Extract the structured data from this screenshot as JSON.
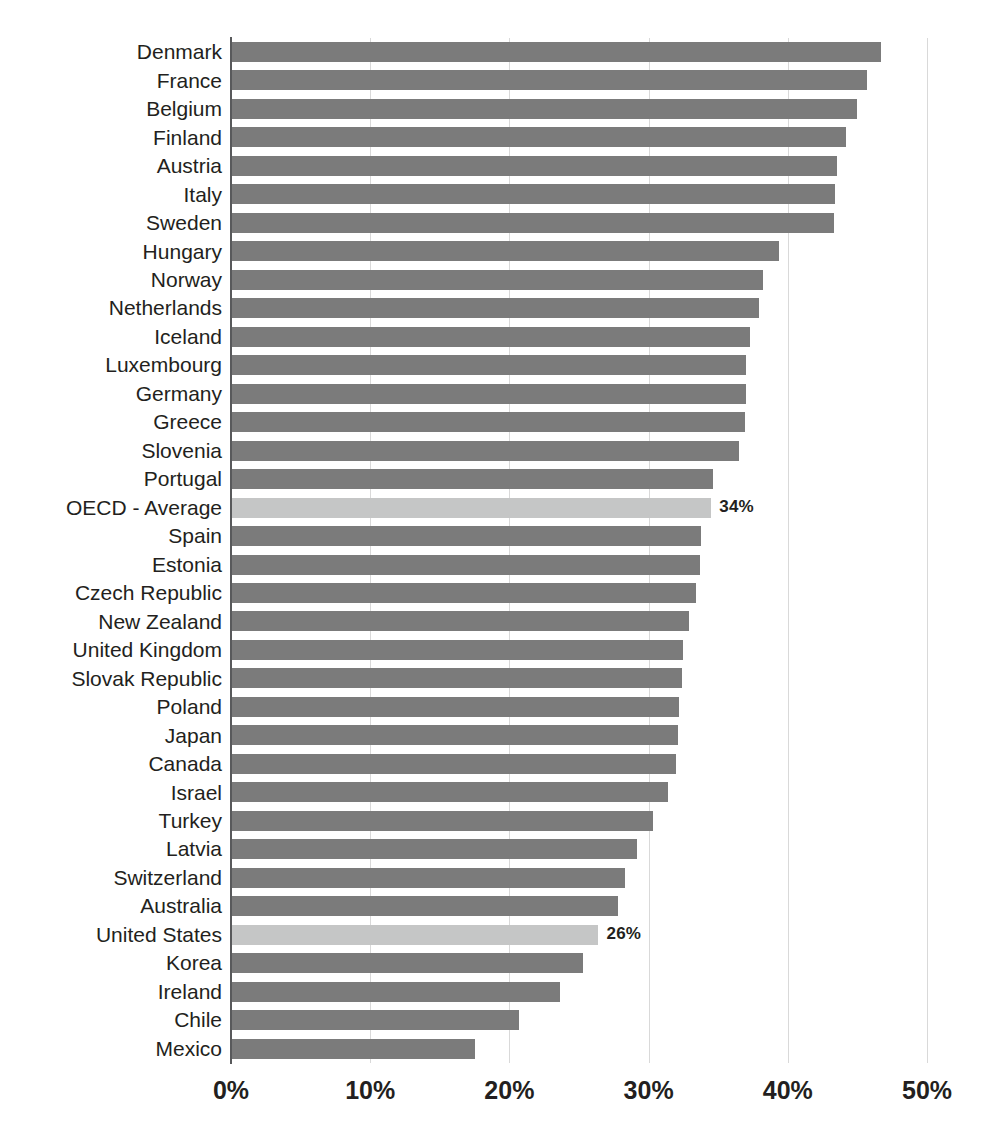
{
  "chart_data": {
    "type": "bar",
    "orientation": "horizontal",
    "title": "",
    "subtitle": "",
    "xlabel": "",
    "ylabel": "",
    "xlim": [
      0,
      50
    ],
    "xtick_labels": [
      "0%",
      "10%",
      "20%",
      "30%",
      "40%",
      "50%"
    ],
    "xtick_values": [
      0,
      10,
      20,
      30,
      40,
      50
    ],
    "grid": "vertical",
    "legend": "none",
    "value_unit": "%",
    "bar_color": "#7b7b7b",
    "highlight_color": "#c5c6c6",
    "categories": [
      "Denmark",
      "France",
      "Belgium",
      "Finland",
      "Austria",
      "Italy",
      "Sweden",
      "Hungary",
      "Norway",
      "Netherlands",
      "Iceland",
      "Luxembourg",
      "Germany",
      "Greece",
      "Slovenia",
      "Portugal",
      "OECD - Average",
      "Spain",
      "Estonia",
      "Czech Republic",
      "New Zealand",
      "United Kingdom",
      "Slovak Republic",
      "Poland",
      "Japan",
      "Canada",
      "Israel",
      "Turkey",
      "Latvia",
      "Switzerland",
      "Australia",
      "United States",
      "Korea",
      "Ireland",
      "Chile",
      "Mexico"
    ],
    "values": [
      46.7,
      45.7,
      45.0,
      44.2,
      43.5,
      43.4,
      43.3,
      39.4,
      38.2,
      37.9,
      37.3,
      37.0,
      37.0,
      36.9,
      36.5,
      34.6,
      34.5,
      33.8,
      33.7,
      33.4,
      32.9,
      32.5,
      32.4,
      32.2,
      32.1,
      32.0,
      31.4,
      30.3,
      29.2,
      28.3,
      27.8,
      26.4,
      25.3,
      23.6,
      20.7,
      17.5
    ],
    "highlighted": [
      "OECD - Average",
      "United States"
    ],
    "data_labels": [
      {
        "category": "OECD - Average",
        "text": "34%"
      },
      {
        "category": "United States",
        "text": "26%"
      }
    ]
  }
}
